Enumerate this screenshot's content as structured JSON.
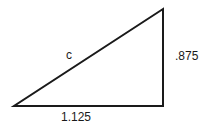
{
  "diagram": {
    "type": "right-triangle",
    "stroke_color": "#1a1a1a",
    "vertices": {
      "bottom_left": [
        14,
        106
      ],
      "bottom_right": [
        163,
        106
      ],
      "top_right": [
        163,
        9
      ]
    },
    "labels": {
      "hypotenuse": "c",
      "vertical_side": ".875",
      "horizontal_side": "1.125"
    }
  }
}
